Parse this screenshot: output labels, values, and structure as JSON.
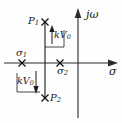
{
  "figure": {
    "kind": "s-plane pole map",
    "axes": {
      "imaginary_label": "jω",
      "real_label": "σ",
      "imaginary_axis_x": 78,
      "real_axis_y": 63,
      "real_axis_from_x": 4,
      "real_axis_to_x": 118,
      "imaginary_axis_from_y": 10,
      "imaginary_axis_to_y": 118
    },
    "markers": [
      {
        "id": "p1",
        "label": "P",
        "sub": "1",
        "glyph": "cross-marker",
        "x": 45,
        "y": 22,
        "label_side": "left"
      },
      {
        "id": "sigma1",
        "label": "σ",
        "sub": "1",
        "glyph": "cross-marker",
        "x": 22,
        "y": 63,
        "label_side": "above"
      },
      {
        "id": "sigma2",
        "label": "σ",
        "sub": "2",
        "glyph": "cross-marker",
        "x": 60,
        "y": 63,
        "label_side": "below"
      },
      {
        "id": "p2",
        "label": "P",
        "sub": "2",
        "glyph": "cross-marker",
        "x": 45,
        "y": 98,
        "label_side": "right"
      }
    ],
    "locus_segment": {
      "name": "vertical-root-locus-branch",
      "x": 45,
      "y_top": 22,
      "y_bottom": 98
    },
    "annotations": [
      {
        "id": "kv-upper",
        "label": "k",
        "label_v": "V",
        "sub": "0",
        "arrow": "up",
        "arrow_x": 52,
        "arrow_from_y": 43,
        "arrow_to_y": 28,
        "bracket": "from real axis up to P1"
      },
      {
        "id": "kv-lower",
        "label": "k",
        "label_v": "V",
        "sub": "0",
        "arrow": "down",
        "arrow_x": 36,
        "arrow_from_y": 72,
        "arrow_to_y": 93,
        "bracket": "from real axis down to P2"
      }
    ],
    "colors": {
      "ink": "#1a1a1a",
      "axis": "#2b2b2b",
      "background": "#fdfdfd"
    }
  }
}
